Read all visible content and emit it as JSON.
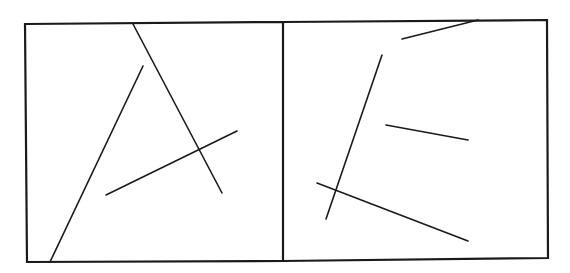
{
  "diagram": {
    "stroke_color": "#1a1a1a",
    "background": "#ffffff",
    "panels": [
      {
        "name": "left-panel",
        "frame": {
          "x1": 25,
          "y1": 24,
          "x2": 283,
          "y2": 262
        },
        "segments": [
          {
            "x1": 133,
            "y1": 24,
            "x2": 222,
            "y2": 193
          },
          {
            "x1": 143,
            "y1": 66,
            "x2": 50,
            "y2": 262
          },
          {
            "x1": 106,
            "y1": 195,
            "x2": 237,
            "y2": 131
          }
        ]
      },
      {
        "name": "right-panel",
        "frame": {
          "x1": 283,
          "y1": 22,
          "x2": 548,
          "y2": 259
        },
        "segments": [
          {
            "x1": 402,
            "y1": 39,
            "x2": 478,
            "y2": 20
          },
          {
            "x1": 382,
            "y1": 55,
            "x2": 326,
            "y2": 219
          },
          {
            "x1": 386,
            "y1": 125,
            "x2": 468,
            "y2": 140
          },
          {
            "x1": 317,
            "y1": 183,
            "x2": 468,
            "y2": 241
          }
        ]
      }
    ]
  }
}
